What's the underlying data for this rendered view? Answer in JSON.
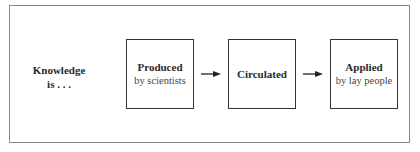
{
  "diagram": {
    "lead_label": [
      "Knowledge",
      "is . . ."
    ],
    "stages": [
      {
        "title": "Produced",
        "subtitle": "by scientists"
      },
      {
        "title": "Circulated",
        "subtitle": ""
      },
      {
        "title": "Applied",
        "subtitle": "by lay people"
      }
    ],
    "connectors": [
      "arrow-right",
      "arrow-right"
    ]
  }
}
